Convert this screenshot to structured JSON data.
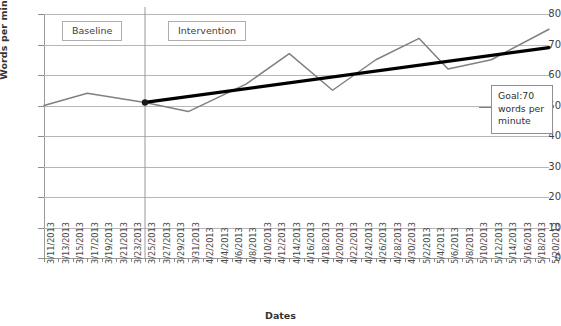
{
  "chart_data": {
    "type": "line",
    "title": "",
    "xlabel": "Dates",
    "ylabel": "Words per minute",
    "ylim": [
      0,
      80
    ],
    "ytick_step": 10,
    "yticks": [
      80,
      70,
      60,
      50,
      40,
      30,
      20,
      10,
      0
    ],
    "grid": true,
    "legend": "none",
    "categories": [
      "3/11/2013",
      "3/13/2013",
      "3/15/2013",
      "3/17/2013",
      "3/19/2013",
      "3/21/2013",
      "3/23/2013",
      "3/25/2013",
      "3/27/2013",
      "3/29/2013",
      "3/31/2013",
      "4/2/2013",
      "4/4/2013",
      "4/6/2013",
      "4/8/2013",
      "4/10/2013",
      "4/12/2013",
      "4/14/2013",
      "4/16/2013",
      "4/18/2013",
      "4/20/2013",
      "4/22/2013",
      "4/24/2013",
      "4/26/2013",
      "4/28/2013",
      "4/30/2013",
      "5/2/2013",
      "5/4/2013",
      "5/6/2013",
      "5/8/2013",
      "5/10/2013",
      "5/12/2013",
      "5/14/2013",
      "5/16/2013",
      "5/18/2013",
      "5/20/2013"
    ],
    "series": [
      {
        "name": "Words per minute",
        "color": "#808080",
        "x": [
          "3/11/2013",
          "3/17/2013",
          "3/25/2013",
          "3/31/2013",
          "4/8/2013",
          "4/14/2013",
          "4/20/2013",
          "4/26/2013",
          "5/2/2013",
          "5/6/2013",
          "5/12/2013",
          "5/20/2013"
        ],
        "values": [
          50,
          54,
          51,
          48,
          57,
          67,
          55,
          65,
          72,
          62,
          65,
          75
        ]
      },
      {
        "name": "Goal line",
        "color": "#000000",
        "x": [
          "3/25/2013",
          "5/20/2013"
        ],
        "values": [
          51,
          69
        ]
      }
    ],
    "markers": [
      {
        "x": "3/25/2013",
        "value": 51,
        "shape": "circle",
        "color": "#1a1a1a"
      }
    ],
    "phase_change_line": {
      "x": "3/25/2013",
      "color": "#9a9a9a"
    },
    "annotations": [
      {
        "name": "baseline",
        "text": "Baseline"
      },
      {
        "name": "intervention",
        "text": "Intervention"
      },
      {
        "name": "goal",
        "text": "Goal:70 words per minute"
      }
    ]
  },
  "annotations": {
    "baseline_label": "Baseline",
    "intervention_label": "Intervention",
    "goal_line1": "Goal:70",
    "goal_line2": "words per",
    "goal_line3": "minute"
  },
  "axes": {
    "y_title": "Words per minute",
    "x_title": "Dates"
  }
}
